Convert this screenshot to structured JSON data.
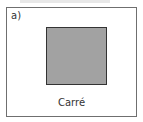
{
  "figure": {
    "label": "a)",
    "shape": "square",
    "caption": "Carré",
    "colors": {
      "fill": "#a2a2a2",
      "border": "#333333",
      "frame": "#6f6f6f"
    }
  }
}
